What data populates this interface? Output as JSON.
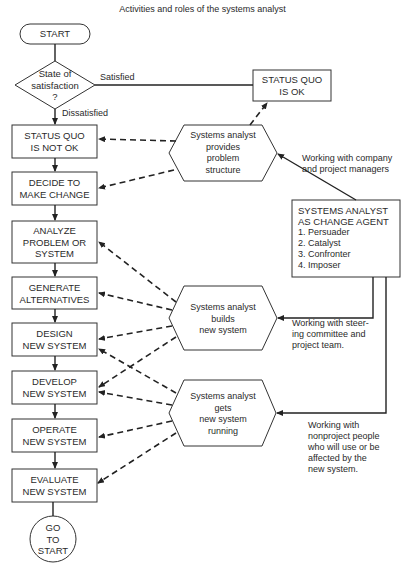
{
  "title": "Activities and roles of the systems analyst",
  "nodes": {
    "start": "START",
    "decision": [
      "State of",
      "satisfaction",
      "?"
    ],
    "status_ok": [
      "STATUS QUO",
      "IS OK"
    ],
    "status_not_ok": [
      "STATUS QUO",
      "IS NOT OK"
    ],
    "decide": [
      "DECIDE TO",
      "MAKE CHANGE"
    ],
    "analyze": [
      "ANALYZE",
      "PROBLEM OR",
      "SYSTEM"
    ],
    "generate": [
      "GENERATE",
      "ALTERNATIVES"
    ],
    "design": [
      "DESIGN",
      "NEW SYSTEM"
    ],
    "develop": [
      "DEVELOP",
      "NEW SYSTEM"
    ],
    "operate": [
      "OPERATE",
      "NEW SYSTEM"
    ],
    "evaluate": [
      "EVALUATE",
      "NEW SYSTEM"
    ],
    "goto": [
      "GO",
      "TO",
      "START"
    ],
    "hex1": [
      "Systems analyst",
      "provides",
      "problem",
      "structure"
    ],
    "hex2": [
      "Systems analyst",
      "builds",
      "new system"
    ],
    "hex3": [
      "Systems analyst",
      "gets",
      "new system",
      "running"
    ],
    "agent": {
      "heading": [
        "SYSTEMS ANALYST",
        "AS CHANGE AGENT"
      ],
      "roles": [
        "1.  Persuader",
        "2.  Catalyst",
        "3.  Confronter",
        "4.  Imposer"
      ]
    }
  },
  "labels": {
    "satisfied": "Satisfied",
    "dissatisfied": "Dissatisfied",
    "managers": [
      "Working with company",
      "and project managers"
    ],
    "steering": [
      "Working with steer-",
      "ing committee and",
      "project team."
    ],
    "nonproject": [
      "Working with",
      "nonproject people",
      "who will use or be",
      "affected by the",
      "new system."
    ]
  }
}
